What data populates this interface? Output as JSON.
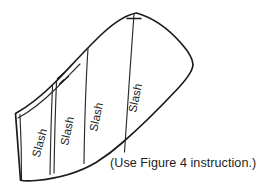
{
  "figure": {
    "kind": "sewing-pattern-slash-diagram",
    "background_color": "#ffffff",
    "outline_color": "#1b1b1b",
    "slash_line_color": "#2a2a2a",
    "text_color": "#232323",
    "caption": "(Use Figure 4 instruction.)",
    "slash_labels": [
      {
        "text": "Slash"
      },
      {
        "text": "Slash"
      },
      {
        "text": "Slash"
      },
      {
        "text": "Slash"
      }
    ],
    "marks": {
      "notch_count": 2,
      "apex_tick": "center-tick"
    }
  }
}
